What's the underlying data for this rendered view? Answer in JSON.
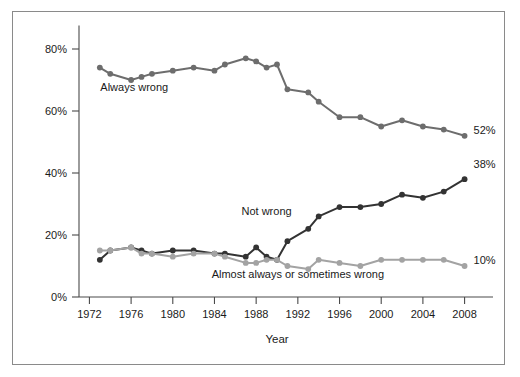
{
  "chart_data": {
    "type": "line",
    "title": "",
    "xlabel": "Year",
    "ylabel": "",
    "x": [
      1973,
      1974,
      1976,
      1977,
      1978,
      1980,
      1982,
      1984,
      1985,
      1987,
      1988,
      1989,
      1990,
      1991,
      1993,
      1994,
      1996,
      1998,
      2000,
      2002,
      2004,
      2006,
      2008
    ],
    "xlim": [
      1971,
      2009
    ],
    "ylim": [
      0,
      85
    ],
    "xticks": [
      1972,
      1976,
      1980,
      1984,
      1988,
      1992,
      1996,
      2000,
      2004,
      2008
    ],
    "xtick_labels": [
      "1972",
      "1976",
      "1980",
      "1984",
      "1988",
      "1992",
      "1996",
      "2000",
      "2004",
      "2008"
    ],
    "yticks": [
      0,
      20,
      40,
      60,
      80
    ],
    "ytick_labels": [
      "0%",
      "20%",
      "40%",
      "60%",
      "80%"
    ],
    "grid": false,
    "legend_position": "inline-annotations",
    "series": [
      {
        "name": "Always wrong",
        "color": "#6d6d6d",
        "label_x": 1976.3,
        "label_y": 66.5,
        "end_label": "52%",
        "values": [
          74,
          72,
          70,
          71,
          72,
          73,
          74,
          73,
          75,
          77,
          76,
          74,
          75,
          67,
          66,
          63,
          58,
          58,
          55,
          57,
          55,
          54,
          52
        ]
      },
      {
        "name": "Not wrong",
        "color": "#333333",
        "label_x": 1989.0,
        "label_y": 26.5,
        "end_label": "38%",
        "values": [
          12,
          15,
          16,
          15,
          14,
          15,
          15,
          14,
          14,
          13,
          16,
          13,
          12,
          18,
          22,
          26,
          29,
          29,
          30,
          33,
          32,
          34,
          38
        ]
      },
      {
        "name": "Almost always or sometimes wrong",
        "color": "#a3a3a3",
        "label_x": 1992.0,
        "label_y": 6.0,
        "end_label": "10%",
        "values": [
          15,
          15,
          16,
          14,
          14,
          13,
          14,
          14,
          13,
          11,
          11,
          12,
          12,
          10,
          9,
          12,
          11,
          10,
          12,
          12,
          12,
          12,
          10
        ]
      }
    ]
  },
  "axes": {
    "x_axis_title": "Year"
  }
}
